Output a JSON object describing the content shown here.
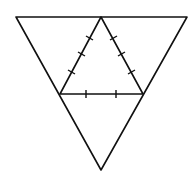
{
  "diagram": {
    "type": "triangle-net",
    "stroke_color": "#111111",
    "background": "#ffffff",
    "outer_triangle": {
      "points": [
        [
          16,
          17
        ],
        [
          187,
          17
        ],
        [
          101,
          170
        ]
      ]
    },
    "inner_triangle": {
      "points": [
        [
          101,
          17
        ],
        [
          60,
          94
        ],
        [
          143,
          94
        ]
      ]
    },
    "tick_marks": {
      "left_side_count": 3,
      "right_side_count": 3,
      "base_count": 2
    }
  }
}
